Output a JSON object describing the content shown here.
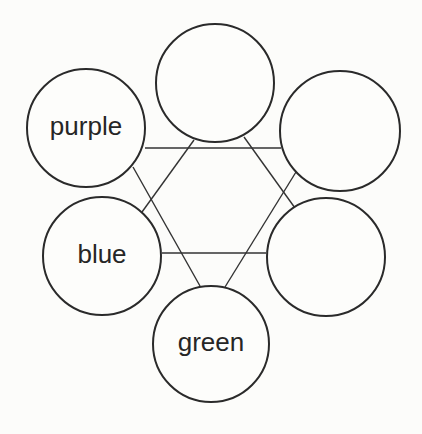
{
  "diagram": {
    "type": "hexagon-circle-graph",
    "nodes": [
      {
        "id": "top",
        "label": "",
        "cx": 215,
        "cy": 83,
        "r": 59
      },
      {
        "id": "purple",
        "label": "purple",
        "cx": 86,
        "cy": 128,
        "r": 59
      },
      {
        "id": "top-right",
        "label": "",
        "cx": 340,
        "cy": 131,
        "r": 60
      },
      {
        "id": "blue",
        "label": "blue",
        "cx": 102,
        "cy": 256,
        "r": 59
      },
      {
        "id": "bottom-right",
        "label": "",
        "cx": 326,
        "cy": 257,
        "r": 59
      },
      {
        "id": "green",
        "label": "green",
        "cx": 211,
        "cy": 344,
        "r": 58
      }
    ],
    "edges": [
      {
        "from": "purple",
        "to": "top-right",
        "x1": 145,
        "y1": 148,
        "x2": 281,
        "y2": 148
      },
      {
        "from": "blue",
        "to": "bottom-right",
        "x1": 162,
        "y1": 253,
        "x2": 266,
        "y2": 253
      },
      {
        "from": "top",
        "to": "blue",
        "x1": 194,
        "y1": 140,
        "x2": 142,
        "y2": 212
      },
      {
        "from": "top",
        "to": "bottom-right",
        "x1": 244,
        "y1": 137,
        "x2": 295,
        "y2": 208
      },
      {
        "from": "purple",
        "to": "green",
        "x1": 133,
        "y1": 167,
        "x2": 200,
        "y2": 286
      },
      {
        "from": "top-right",
        "to": "green",
        "x1": 296,
        "y1": 172,
        "x2": 225,
        "y2": 287
      }
    ]
  }
}
